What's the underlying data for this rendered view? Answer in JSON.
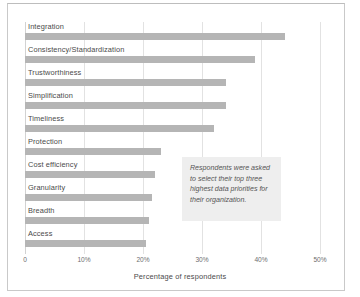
{
  "chart_data": {
    "type": "bar",
    "orientation": "horizontal",
    "title": "",
    "xlabel": "Percentage of respondents",
    "ylabel": "",
    "xlim": [
      0,
      50
    ],
    "grid": true,
    "legend": null,
    "categories": [
      "Integration",
      "Consistency/Standardization",
      "Trustworthiness",
      "Simplification",
      "Timeliness",
      "Protection",
      "Cost efficiency",
      "Granularity",
      "Breadth",
      "Access"
    ],
    "values": [
      44,
      39,
      34,
      34,
      32,
      23,
      22,
      21.5,
      21,
      20.5
    ],
    "xticks": [
      0,
      10,
      20,
      30,
      40,
      50
    ],
    "xtick_labels": [
      "0",
      "10%",
      "20%",
      "30%",
      "40%",
      "50%"
    ],
    "bar_color": "#b5b5b5",
    "annotations": [
      "Respondents were asked to select their top three highest data priorities for their organization."
    ]
  },
  "annotation_box": {
    "text": "Respondents were asked to select their top three highest data priorities for their organization.",
    "background": "#eeeeee"
  }
}
